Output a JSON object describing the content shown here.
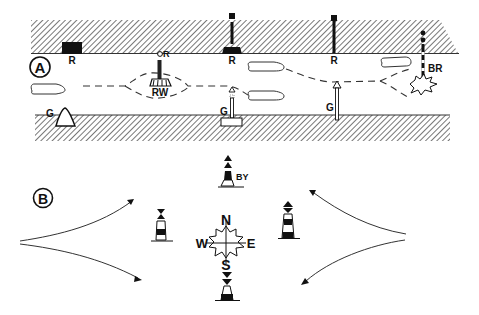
{
  "figure": {
    "panel_a": {
      "label": "A",
      "top_bank_marks": [
        {
          "type": "red-can-beacon-square",
          "label": "R"
        },
        {
          "type": "red-spar-light",
          "label": "R"
        },
        {
          "type": "red-pile-beacon",
          "label": "R"
        },
        {
          "type": "red-pile-post",
          "label": "R"
        }
      ],
      "mid_channel_marks": [
        {
          "type": "red-white-safe-water-mark",
          "label": "RW",
          "light_label": "R"
        },
        {
          "type": "black-red-isolated-danger",
          "label": "BR"
        }
      ],
      "bottom_bank_marks": [
        {
          "type": "green-conical-beacon",
          "label": "G"
        },
        {
          "type": "green-light-beacon",
          "label": "G"
        },
        {
          "type": "green-pile-post",
          "label": "G"
        }
      ],
      "boats": 4
    },
    "panel_b": {
      "label": "B",
      "compass": {
        "n": "N",
        "s": "S",
        "e": "E",
        "w": "W"
      },
      "north_cardinal_label": "BY",
      "cardinal_marks": [
        "north",
        "east",
        "south",
        "west"
      ]
    },
    "colors": {
      "ink": "#111111",
      "hatch": "#555555",
      "background": "#ffffff"
    }
  }
}
